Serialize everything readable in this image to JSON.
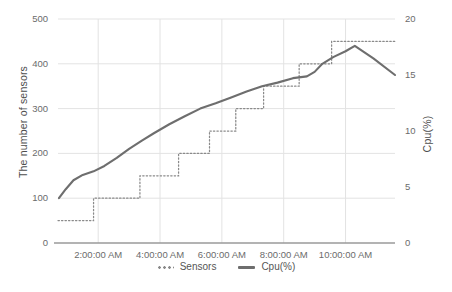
{
  "chart_data": {
    "type": "line",
    "title": "",
    "xlabel": "",
    "ylabel": "The number of sensors",
    "y2label": "Cpu(%)",
    "grid": true,
    "legend_position": "bottom",
    "ylim": [
      0,
      500
    ],
    "y2lim": [
      0,
      20
    ],
    "yticks": [
      "0",
      "100",
      "200",
      "300",
      "400",
      "500"
    ],
    "y2ticks": [
      "0",
      "5",
      "10",
      "15",
      "20"
    ],
    "xticks": [
      "2:00:00 AM",
      "4:00:00 AM",
      "6:00:00 AM",
      "8:00:00 AM",
      "10:00:00 AM"
    ],
    "xlim_hours": [
      0.7,
      11.6
    ],
    "series": [
      {
        "name": "Sensors",
        "style": "dotted-step",
        "axis": "left",
        "color": "#8a8a8a",
        "x_hours": [
          0.7,
          1.85,
          1.85,
          3.35,
          3.35,
          4.6,
          4.6,
          5.6,
          5.6,
          6.45,
          6.45,
          7.35,
          7.35,
          8.5,
          8.5,
          9.55,
          9.55,
          11.6
        ],
        "values": [
          50,
          50,
          100,
          100,
          150,
          150,
          200,
          200,
          250,
          250,
          300,
          300,
          350,
          350,
          400,
          400,
          450,
          450
        ]
      },
      {
        "name": "Cpu(%)",
        "style": "solid-line",
        "axis": "right",
        "color": "#6e6e6e",
        "x_hours": [
          0.73,
          0.95,
          1.2,
          1.5,
          1.85,
          2.2,
          2.6,
          3.0,
          3.4,
          3.8,
          4.3,
          4.8,
          5.3,
          5.8,
          6.3,
          6.8,
          7.3,
          7.8,
          8.3,
          8.75,
          9.0,
          9.25,
          9.6,
          10.0,
          10.3,
          10.9,
          11.6
        ],
        "values_left": [
          100,
          120,
          140,
          152,
          160,
          172,
          190,
          210,
          228,
          245,
          265,
          283,
          300,
          312,
          325,
          338,
          350,
          358,
          368,
          372,
          382,
          400,
          415,
          428,
          440,
          412,
          375
        ],
        "values_right": [
          4.0,
          4.8,
          5.6,
          6.08,
          6.4,
          6.88,
          7.6,
          8.4,
          9.12,
          9.8,
          10.6,
          11.32,
          12.0,
          12.48,
          13.0,
          13.52,
          14.0,
          14.32,
          14.72,
          14.88,
          15.28,
          16.0,
          16.6,
          17.12,
          17.6,
          16.48,
          15.0
        ]
      }
    ]
  },
  "legend": {
    "items": [
      {
        "label": "Sensors",
        "marker": "dotted"
      },
      {
        "label": "Cpu(%)",
        "marker": "solid"
      }
    ]
  }
}
